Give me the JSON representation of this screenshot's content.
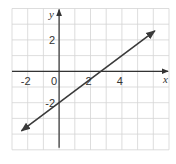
{
  "chart_data": {
    "type": "line",
    "title": "",
    "xlabel": "x",
    "ylabel": "y",
    "xlim": [
      -3,
      7
    ],
    "ylim": [
      -5,
      4
    ],
    "grid": true,
    "grid_step": 1,
    "x_ticks": [
      {
        "value": -2,
        "label": "-2"
      },
      {
        "value": 0,
        "label": "0"
      },
      {
        "value": 2,
        "label": "2"
      },
      {
        "value": 4,
        "label": "4"
      }
    ],
    "y_ticks": [
      {
        "value": 2,
        "label": "2"
      },
      {
        "value": -2,
        "label": "-2"
      }
    ],
    "series": [
      {
        "name": "line",
        "equation": "y = 0.75x - 2",
        "slope": 0.75,
        "intercept": -2,
        "x": [
          -2.4,
          6.1
        ],
        "y": [
          -3.8,
          2.575
        ],
        "arrows": "both"
      }
    ],
    "colors": {
      "grid": "#d4d4d4",
      "axis": "#333333",
      "line": "#3a3a3a"
    }
  }
}
